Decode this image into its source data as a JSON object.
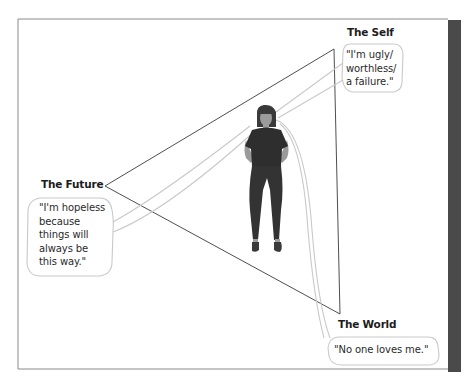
{
  "diagram": {
    "type": "cognitive-triad",
    "colors": {
      "frame": "#8a8a8a",
      "side_bar": "#4a4a4a",
      "triangle": "#3a3a3a",
      "bubble_outline": "#c8c8c8",
      "figure_clothing": "#2e2e2e",
      "figure_skin": "#9a9a9a"
    },
    "nodes": [
      {
        "id": "self",
        "title": "The Self",
        "quote": "\"I'm ugly/\nworthless/\na failure.\""
      },
      {
        "id": "future",
        "title": "The Future",
        "quote": "\"I'm hopeless\nbecause\nthings will\nalways be\nthis way.\""
      },
      {
        "id": "world",
        "title": "The World",
        "quote": "\"No one loves me.\""
      }
    ],
    "center_figure": "standing-person-icon"
  }
}
